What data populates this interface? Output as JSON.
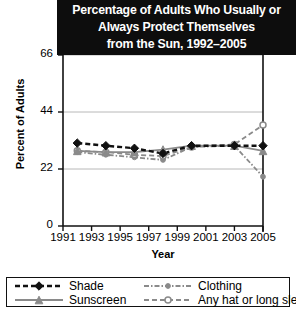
{
  "title": {
    "lines": [
      "Percentage of Adults Who Usually or",
      "Always Protect Themselves",
      "from the Sun, 1992–2005"
    ]
  },
  "axes": {
    "ylabel": "Percent of Adults",
    "xlabel": "Year",
    "yticks": [
      "0",
      "22",
      "44",
      "66"
    ],
    "xticks": [
      "1991",
      "1993",
      "1995",
      "1997",
      "1999",
      "2001",
      "2003",
      "2005"
    ]
  },
  "legend": {
    "items": [
      {
        "label": "Shade",
        "key": "shade"
      },
      {
        "label": "Sunscreen",
        "key": "sunscreen"
      },
      {
        "label": "Clothing",
        "key": "clothing"
      },
      {
        "label": "Any hat or long sleeves",
        "key": "hat"
      }
    ]
  },
  "colors": {
    "dark": "#111111",
    "gray": "#8a8a8a",
    "grid": "#b8b8b8",
    "banner": "#0d0d0d",
    "banner_text": "#ffffff",
    "background": "#ffffff"
  },
  "chart_data": {
    "type": "line",
    "title": "Percentage of Adults Who Usually or Always Protect Themselves from the Sun, 1992–2005",
    "xlabel": "Year",
    "ylabel": "Percent of Adults",
    "xlim": [
      1991,
      2005
    ],
    "ylim": [
      0,
      66
    ],
    "yticks": [
      0,
      22,
      44,
      66
    ],
    "xticks": [
      1991,
      1993,
      1995,
      1997,
      1999,
      2001,
      2003,
      2005
    ],
    "grid": "horizontal",
    "legend_position": "bottom",
    "x": [
      1992,
      1994,
      1996,
      1998,
      2000,
      2003,
      2005
    ],
    "series": [
      {
        "name": "Shade",
        "color": "#111111",
        "style": "dashed",
        "marker": "diamond",
        "values": [
          32,
          31,
          30,
          28,
          31,
          31,
          31
        ]
      },
      {
        "name": "Sunscreen",
        "color": "#8a8a8a",
        "style": "solid",
        "marker": "triangle",
        "values": [
          29,
          28.5,
          28.5,
          29.5,
          31,
          31,
          29
        ]
      },
      {
        "name": "Clothing",
        "color": "#8a8a8a",
        "style": "dashdot",
        "marker": "dot",
        "values": [
          28.5,
          27.5,
          26.5,
          25.5,
          30.5,
          31,
          19
        ]
      },
      {
        "name": "Any hat or long sleeves",
        "color": "#8a8a8a",
        "style": "dashed",
        "marker": "circle",
        "values": [
          29,
          28.5,
          27.5,
          27,
          30.5,
          31.5,
          39
        ]
      }
    ]
  }
}
